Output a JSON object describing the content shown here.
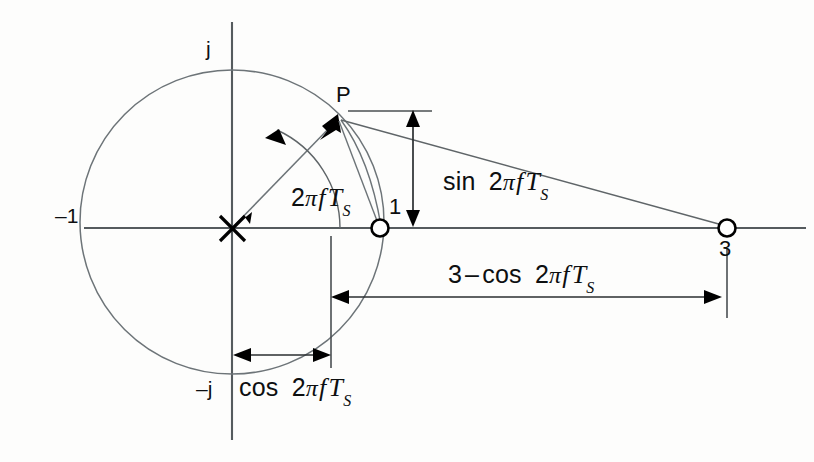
{
  "figure": {
    "background_color": "#fdfdfc",
    "line_color": "#5f6568",
    "ink_color": "#0d0f10"
  },
  "axes": {
    "real_axis_name": "real-axis",
    "imag_axis_name": "imaginary-axis",
    "labels": {
      "imag_positive": "j",
      "imag_negative": "–j",
      "real_negative_one": "–1"
    }
  },
  "points": {
    "origin_marker": "×",
    "p": "P",
    "one": "1",
    "three": "3"
  },
  "expressions": {
    "angle": {
      "prefix": "2",
      "pi": "π",
      "f": "f",
      "T": "T",
      "sub": "S"
    },
    "sin_label": {
      "fn": "sin",
      "prefix": "2",
      "pi": "π",
      "f": "f",
      "T": "T",
      "sub": "S"
    },
    "cos_label": {
      "fn": "cos",
      "prefix": "2",
      "pi": "π",
      "f": "f",
      "T": "T",
      "sub": "S"
    },
    "three_minus_cos_label": {
      "lead": "3",
      "minus": "–",
      "fn": "cos",
      "prefix": "2",
      "pi": "π",
      "f": "f",
      "T": "T",
      "sub": "S"
    }
  },
  "geometry": {
    "origin": {
      "x": 232,
      "y": 228
    },
    "circle": {
      "cx": 232,
      "cy": 222,
      "r": 152
    },
    "point_p": {
      "x": 338,
      "y": 118
    },
    "point_one": {
      "x": 380,
      "y": 228
    },
    "point_three": {
      "x": 727,
      "y": 228
    },
    "angle_degrees": 45,
    "dimension_sin": {
      "x": 413,
      "y_top": 113,
      "y_bottom": 224
    },
    "dimension_cos": {
      "y": 355,
      "x_left": 233,
      "x_right": 331
    },
    "dimension_three_minus_cos": {
      "y": 297,
      "x_left": 332,
      "x_right": 721
    }
  }
}
